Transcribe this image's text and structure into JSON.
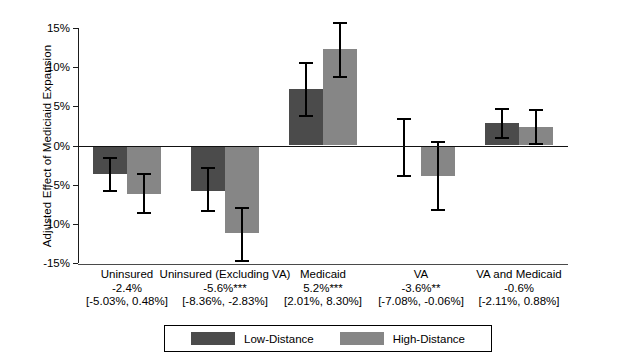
{
  "chart_data": {
    "type": "bar",
    "title": "",
    "subtitle": "",
    "xlabel": "",
    "ylabel": "Adjusted Effect of Mediciaid Expansion",
    "ylim": [
      -15,
      15
    ],
    "ytick_values": [
      15,
      10,
      5,
      0,
      -5,
      -10,
      -15
    ],
    "ytick_labels": [
      "15%",
      "10%",
      "5%",
      "0%",
      "-5%",
      "-10%",
      "-15%"
    ],
    "grid": false,
    "legend_position": "bottom-center",
    "orientation": "vertical",
    "error_bars": "95% confidence interval",
    "categories": [
      "Uninsured",
      "Uninsured (Excluding VA)",
      "Medicaid",
      "VA",
      "VA and Medicaid"
    ],
    "category_annotations": [
      {
        "name": "Uninsured",
        "estimate": "-2.4%",
        "interval": "[-5.03%, 0.48%]"
      },
      {
        "name": "Uninsured (Excluding VA)",
        "estimate": "-5.6%***",
        "interval": "[-8.36%, -2.83%]"
      },
      {
        "name": "Medicaid",
        "estimate": "5.2%***",
        "interval": "[2.01%, 8.30%]"
      },
      {
        "name": "VA",
        "estimate": "-3.6%**",
        "interval": "[-7.08%, -0.06%]"
      },
      {
        "name": "VA and Medicaid",
        "estimate": "-0.6%",
        "interval": "[-2.11%, 0.88%]"
      }
    ],
    "series": [
      {
        "name": "Low-Distance",
        "color": "#4b4b4b",
        "values": [
          -3.7,
          -5.8,
          7.2,
          -0.1,
          2.9
        ],
        "ci_low": [
          -5.8,
          -8.3,
          3.8,
          -3.9,
          1.0
        ],
        "ci_high": [
          -1.6,
          -2.9,
          10.5,
          3.4,
          4.7
        ]
      },
      {
        "name": "High-Distance",
        "color": "#868686",
        "values": [
          -6.2,
          -11.2,
          12.3,
          -3.9,
          2.3
        ],
        "ci_low": [
          -8.6,
          -14.7,
          8.8,
          -8.2,
          0.2
        ],
        "ci_high": [
          -3.6,
          -8.0,
          15.7,
          0.5,
          4.5
        ]
      }
    ]
  },
  "legend": {
    "items": [
      {
        "label": "Low-Distance",
        "color": "#4b4b4b"
      },
      {
        "label": "High-Distance",
        "color": "#868686"
      }
    ]
  }
}
